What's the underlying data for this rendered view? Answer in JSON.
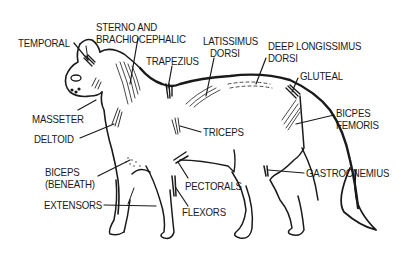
{
  "diagram": {
    "ink_color": "#1a1a1a",
    "background": "#ffffff",
    "labels": [
      {
        "id": "temporal",
        "lines": [
          "TEMPORAL"
        ],
        "x": 18,
        "y": 37
      },
      {
        "id": "sterno-brachiocephalic",
        "lines": [
          "STERNO AND",
          "BRACHIOCEPHALIC"
        ],
        "x": 96,
        "y": 21
      },
      {
        "id": "trapezius",
        "lines": [
          "TRAPEZIUS"
        ],
        "x": 146,
        "y": 55
      },
      {
        "id": "latissimus-dorsi",
        "lines": [
          "LATISSIMUS",
          "DORSI"
        ],
        "x": 203,
        "y": 35
      },
      {
        "id": "deep-longissimus-dorsi",
        "lines": [
          "DEEP LONGISSIMUS",
          "DORSI"
        ],
        "x": 268,
        "y": 40
      },
      {
        "id": "gluteal",
        "lines": [
          "GLUTEAL"
        ],
        "x": 300,
        "y": 70
      },
      {
        "id": "masseter",
        "lines": [
          "MASSETER"
        ],
        "x": 32,
        "y": 113
      },
      {
        "id": "deltoid",
        "lines": [
          "DELTOID"
        ],
        "x": 34,
        "y": 133
      },
      {
        "id": "triceps",
        "lines": [
          "TRICEPS"
        ],
        "x": 203,
        "y": 126
      },
      {
        "id": "bicpes-femoris",
        "lines": [
          "BICPES",
          "FEMORIS"
        ],
        "x": 336,
        "y": 107
      },
      {
        "id": "biceps-beneath",
        "lines": [
          "BICEPS",
          "(BENEATH)"
        ],
        "x": 45,
        "y": 166
      },
      {
        "id": "pectorals",
        "lines": [
          "PECTORALS"
        ],
        "x": 185,
        "y": 180
      },
      {
        "id": "gastrocnemius",
        "lines": [
          "GASTROCNEMIUS"
        ],
        "x": 306,
        "y": 167
      },
      {
        "id": "extensors",
        "lines": [
          "EXTENSORS"
        ],
        "x": 44,
        "y": 199
      },
      {
        "id": "flexors",
        "lines": [
          "FLEXORS"
        ],
        "x": 182,
        "y": 206
      }
    ]
  }
}
